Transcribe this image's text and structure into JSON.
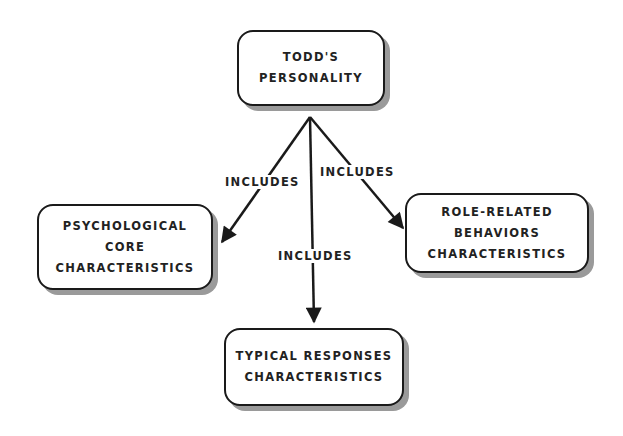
{
  "diagram": {
    "root": {
      "lines": [
        "TODD'S",
        "PERSONALITY"
      ]
    },
    "children": [
      {
        "id": "psych",
        "lines": [
          "PSYCHOLOGICAL",
          "CORE",
          "CHARACTERISTICS"
        ]
      },
      {
        "id": "typical",
        "lines": [
          "TYPICAL RESPONSES",
          "CHARACTERISTICS"
        ]
      },
      {
        "id": "role",
        "lines": [
          "ROLE-RELATED",
          "BEHAVIORS",
          "CHARACTERISTICS"
        ]
      }
    ],
    "edges": [
      {
        "from": "root",
        "to": "psych",
        "label": "INCLUDES"
      },
      {
        "from": "root",
        "to": "typical",
        "label": "INCLUDES"
      },
      {
        "from": "root",
        "to": "role",
        "label": "INCLUDES"
      }
    ]
  },
  "colors": {
    "stroke": "#1a1a1a",
    "shadow": "#9a9a9a",
    "text": "#222222",
    "background": "#ffffff"
  }
}
